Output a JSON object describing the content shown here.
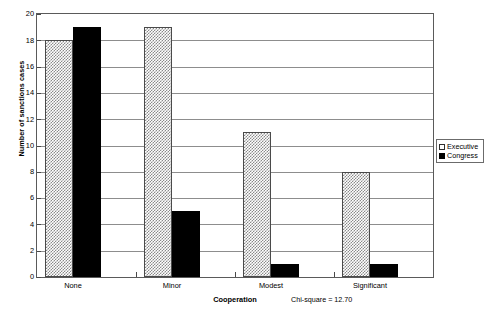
{
  "chart_data": {
    "type": "bar",
    "title": "",
    "subtitle": "",
    "xlabel": "Cooperation",
    "ylabel": "Number of sanctions cases",
    "categories": [
      "None",
      "Minor",
      "Modest",
      "Significant"
    ],
    "series": [
      {
        "name": "Executive",
        "values": [
          18,
          19,
          11,
          8
        ],
        "fill": "light-checker",
        "color": "#d9d9d9"
      },
      {
        "name": "Congress",
        "values": [
          19,
          5,
          1,
          1
        ],
        "fill": "solid",
        "color": "#000000"
      }
    ],
    "ylim": [
      0,
      20
    ],
    "yticks": [
      0,
      2,
      4,
      6,
      8,
      10,
      12,
      14,
      16,
      18,
      20
    ],
    "ytick_labels": [
      "0",
      "2",
      "4",
      "6",
      "8",
      "10",
      "12",
      "14",
      "16",
      "18",
      "20"
    ],
    "grid": "horizontal",
    "legend_position": "right",
    "annotation": "Chi-square = 12.70",
    "chi_square_value": "12.70"
  },
  "legend": {
    "entries": [
      {
        "label": "Executive",
        "swatch": "executive"
      },
      {
        "label": "Congress",
        "swatch": "congress"
      }
    ]
  },
  "colors": {
    "axis": "#5a5a5a",
    "gridline": "#8d8d8d",
    "executive": "#d9d9d9",
    "congress": "#000000",
    "background": "#ffffff"
  }
}
